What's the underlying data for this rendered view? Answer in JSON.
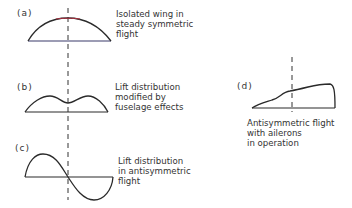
{
  "panels": [
    {
      "id": "a",
      "tag": "(a)",
      "caption": [
        "Isolated wing in",
        "steady symmetric",
        "flight"
      ]
    },
    {
      "id": "b",
      "tag": "(b)",
      "caption": [
        "Lift distribution",
        "modified by",
        "fuselage effects"
      ]
    },
    {
      "id": "c",
      "tag": "(c)",
      "caption": [
        "Lift distribution",
        "in antisymmetric",
        "flight"
      ]
    },
    {
      "id": "d",
      "tag": "(d)",
      "caption": [
        "Antisymmetric flight",
        "with ailerons",
        "in operation"
      ]
    }
  ],
  "colors": {
    "line": "#2a2a2a",
    "baseline_a": "#3a3a6a",
    "peak_a": "#b03040"
  }
}
